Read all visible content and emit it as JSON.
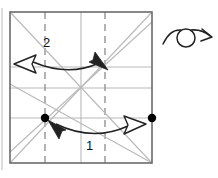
{
  "figure": {
    "kind": "origami-crease-pattern-diagram",
    "canvas": {
      "width": 218,
      "height": 178,
      "background": "#ffffff"
    },
    "colors": {
      "paper_border": "#6b6b6b",
      "crease_line": "#b9b9b9",
      "arrow": "#222222",
      "dot": "#000000",
      "page_edge": "#c9c9c9"
    },
    "square": {
      "x": 10,
      "y": 12,
      "width": 142,
      "height": 151
    },
    "horizontal_creases": [
      {
        "name": "upper-crease",
        "y": 67
      },
      {
        "name": "center-crease",
        "y": 88
      },
      {
        "name": "lower-crease",
        "y": 118
      }
    ],
    "vertical_creases": [
      {
        "name": "left-dashed-crease",
        "x": 45,
        "style": "dashed"
      },
      {
        "name": "center-vertical-crease",
        "x": 81,
        "style": "solid"
      },
      {
        "name": "right-dashed-crease",
        "x": 105,
        "style": "dashed"
      }
    ],
    "diagonals": [
      {
        "name": "diagonal-tl-br",
        "x1": 10,
        "y1": 12,
        "x2": 152,
        "y2": 163
      },
      {
        "name": "diagonal-bl-tr",
        "x1": 10,
        "y1": 163,
        "x2": 152,
        "y2": 12
      },
      {
        "name": "diagonal-through-dot-up-right",
        "x1": 10,
        "y1": 152,
        "x2": 152,
        "y2": 22
      },
      {
        "name": "diagonal-through-dot-down-right",
        "x1": 10,
        "y1": 84,
        "x2": 152,
        "y2": 163
      }
    ],
    "dots": [
      {
        "name": "reference-dot-left",
        "cx": 45,
        "cy": 118,
        "r": 4.2
      },
      {
        "name": "reference-dot-right",
        "cx": 152,
        "cy": 118,
        "r": 4.2
      }
    ]
  },
  "annotations": {
    "step_one": {
      "label": "1",
      "label_x": 86,
      "label_y": 139,
      "arrow_name": "fold-arrow-1",
      "description": "double-headed arc from right dot to left dot",
      "head_left_style": "solid",
      "head_right_style": "hollow"
    },
    "step_two": {
      "label": "2",
      "label_x": 43,
      "label_y": 36,
      "arrow_name": "fold-arrow-2",
      "description": "double-headed arc across upper crease",
      "head_left_style": "hollow",
      "head_right_style": "solid"
    },
    "turn_over": {
      "name": "turn-over-symbol",
      "description": "looped arc arrow indicating turn the paper over",
      "loop_cx": 186,
      "loop_cy": 38,
      "loop_r": 9
    }
  }
}
